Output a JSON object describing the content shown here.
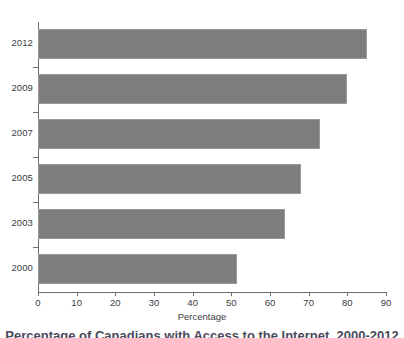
{
  "chart_data": {
    "type": "bar",
    "orientation": "horizontal",
    "title": "",
    "xlabel": "Percentage",
    "ylabel": "",
    "categories": [
      "2012",
      "2009",
      "2007",
      "2005",
      "2003",
      "2000"
    ],
    "values": [
      85,
      80,
      73,
      68,
      64,
      51.5
    ],
    "series": [
      {
        "name": "Percentage",
        "values": [
          85,
          80,
          73,
          68,
          64,
          51.5
        ]
      }
    ],
    "xlim": [
      0,
      90
    ],
    "xticks": [
      0,
      10,
      20,
      30,
      40,
      50,
      60,
      70,
      80,
      90
    ],
    "xtick_labels": [
      "0",
      "10",
      "20",
      "30",
      "40",
      "50",
      "60",
      "70",
      "80",
      "90"
    ],
    "grid": false,
    "legend": false,
    "legend_position": "none",
    "bar_color": "#7d7d7d",
    "bar_border_color": "#9a9a9a",
    "axis_color": "#6f6f78",
    "text_color": "#3b3b44"
  },
  "caption": {
    "text": "Percentage of Canadians with Access to the Internet, 2000-2012",
    "note": "clipped at bottom edge of screenshot"
  }
}
